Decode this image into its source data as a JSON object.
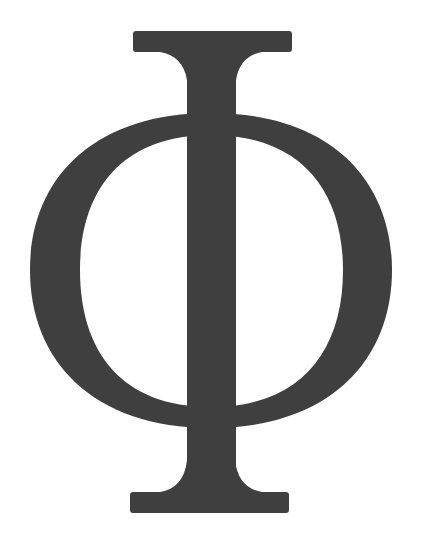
{
  "symbol": {
    "character": "Φ",
    "name": "Greek capital letter Phi",
    "color": "#3f3f3f",
    "background": "#ffffff"
  }
}
